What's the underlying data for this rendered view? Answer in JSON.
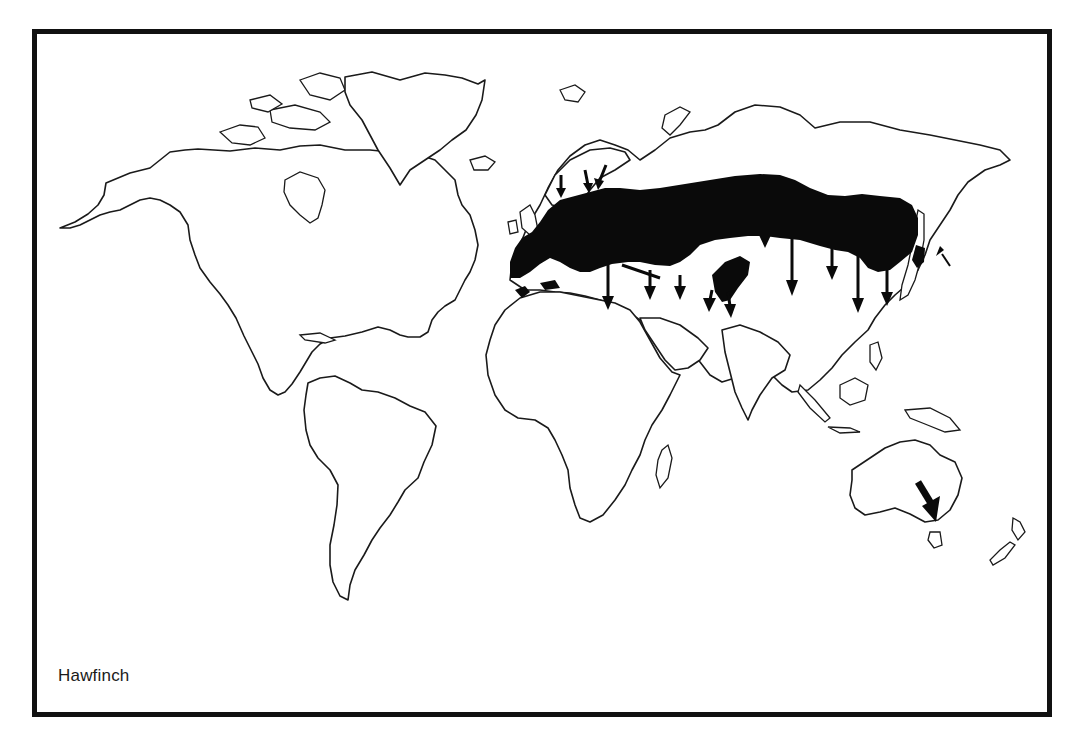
{
  "map": {
    "species_label": "Hawfinch",
    "colors": {
      "frame": "#111111",
      "coastline": "#1a1a1a",
      "range_fill": "#0a0a0a",
      "background": "#ffffff"
    },
    "layers": [
      {
        "name": "coastline",
        "style": "outline"
      },
      {
        "name": "breeding-range",
        "style": "solid-black",
        "regions": [
          "Europe",
          "North Africa",
          "Temperate Asia",
          "Japan",
          "Central Asia"
        ]
      },
      {
        "name": "migration-arrows",
        "style": "black arrows",
        "direction": "south",
        "count": 14
      }
    ]
  }
}
